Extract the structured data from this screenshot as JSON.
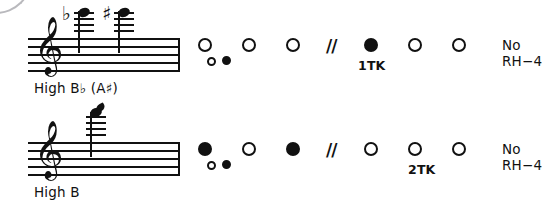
{
  "figure": {
    "type": "woodwind-fingering-chart",
    "corner_mark": "arc"
  },
  "rows": [
    {
      "id": "high-b-flat",
      "note_label": "High B♭ (A♯)",
      "clef": "treble-clef",
      "notes": [
        {
          "accidental": "♭",
          "name": "B-flat"
        },
        {
          "accidental": "♯",
          "name": "A-sharp"
        }
      ],
      "left_hand": [
        {
          "name": "lh-1",
          "state": "open"
        },
        {
          "name": "lh-2",
          "state": "open"
        },
        {
          "name": "lh-3",
          "state": "open"
        }
      ],
      "left_hand_aux": [
        {
          "name": "lh-aux-1",
          "state": "open"
        },
        {
          "name": "lh-aux-2",
          "state": "closed"
        }
      ],
      "separator": "//",
      "right_hand": [
        {
          "name": "rh-1",
          "state": "closed"
        },
        {
          "name": "rh-2",
          "state": "open"
        },
        {
          "name": "rh-3",
          "state": "open"
        }
      ],
      "octave_key": "1TK",
      "note_text": "No RH−4"
    },
    {
      "id": "high-b",
      "note_label": "High B",
      "clef": "treble-clef",
      "notes": [
        {
          "accidental": "",
          "name": "B"
        }
      ],
      "left_hand": [
        {
          "name": "lh-1",
          "state": "closed"
        },
        {
          "name": "lh-2",
          "state": "open"
        },
        {
          "name": "lh-3",
          "state": "closed"
        }
      ],
      "left_hand_aux": [
        {
          "name": "lh-aux-1",
          "state": "open"
        },
        {
          "name": "lh-aux-2",
          "state": "closed"
        }
      ],
      "separator": "//",
      "right_hand": [
        {
          "name": "rh-1",
          "state": "open"
        },
        {
          "name": "rh-2",
          "state": "open"
        },
        {
          "name": "rh-3",
          "state": "open"
        }
      ],
      "octave_key": "2TK",
      "note_text": "No RH−4"
    }
  ],
  "glyphs": {
    "treble_clef": "𝄞"
  }
}
